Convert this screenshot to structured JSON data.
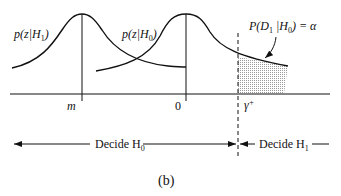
{
  "figure": {
    "caption": "(b)",
    "curves": [
      {
        "name": "p(z|H1)",
        "label_main": "p(z|H",
        "label_sub": "1",
        "label_close": ")",
        "peak_x_label": "m"
      },
      {
        "name": "p(z|H0)",
        "label_main": "p(z|H",
        "label_sub": "0",
        "label_close": ")",
        "peak_x_label": "0"
      }
    ],
    "threshold": {
      "label": "γ",
      "sup": "+"
    },
    "annotation": {
      "prefix": "P(D",
      "sub1": "1",
      "mid": " |H",
      "sub2": "0",
      "suffix": ") = α"
    },
    "regions": {
      "left": {
        "text": "Decide H",
        "sub": "0"
      },
      "right": {
        "text": "Decide H",
        "sub": "1"
      }
    },
    "colors": {
      "line": "#111111",
      "hatch": "#9a9a9a"
    }
  }
}
